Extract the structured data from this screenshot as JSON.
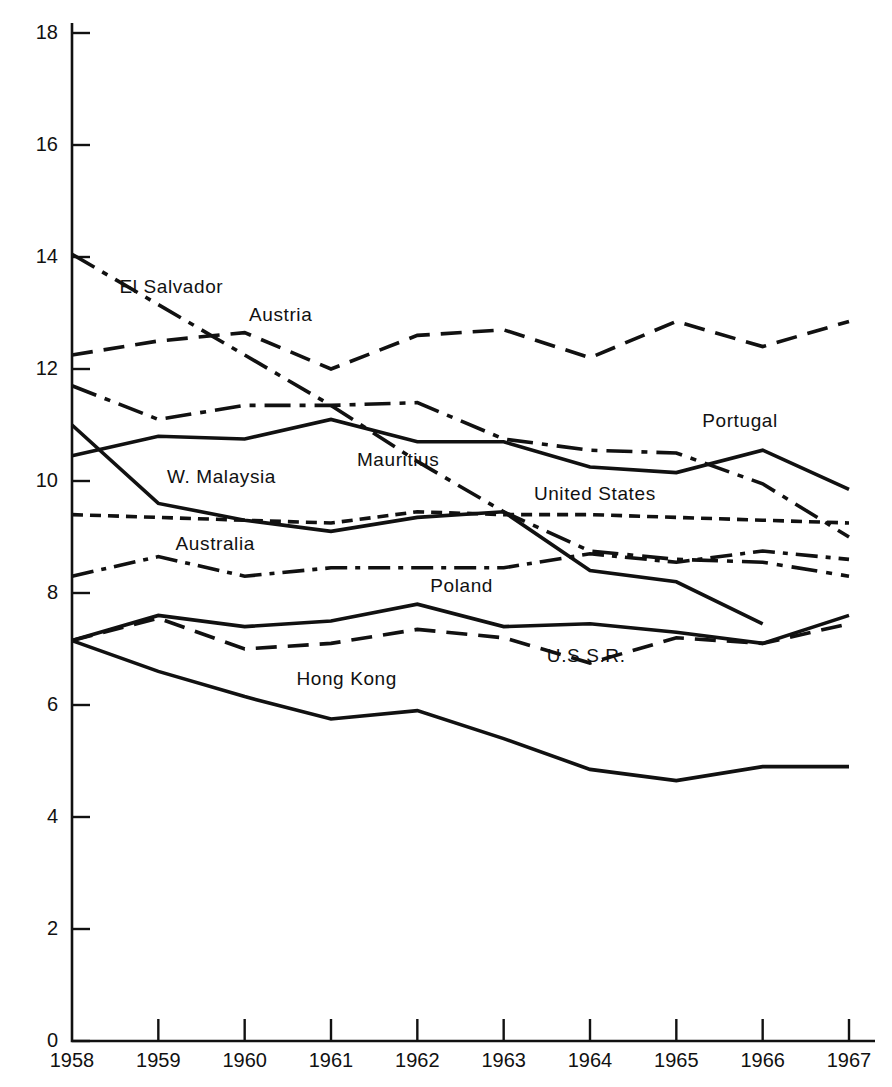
{
  "chart_data": {
    "type": "line",
    "title": "",
    "subtitle": "",
    "xlabel": "",
    "ylabel": "",
    "x": [
      1958,
      1959,
      1960,
      1961,
      1962,
      1963,
      1964,
      1965,
      1966,
      1967
    ],
    "categories": [
      "1958",
      "1959",
      "1960",
      "1961",
      "1962",
      "1963",
      "1964",
      "1965",
      "1966",
      "1967"
    ],
    "xlim": [
      1958,
      1967
    ],
    "ylim": [
      0,
      18
    ],
    "ytick_labels": [
      "0",
      "2",
      "4",
      "6",
      "8",
      "10",
      "12",
      "14",
      "16",
      "18"
    ],
    "ytick_values": [
      0,
      2,
      4,
      6,
      8,
      10,
      12,
      14,
      16,
      18
    ],
    "grid": false,
    "legend_position": "inline-labels",
    "series": [
      {
        "name": "El Salvador",
        "style": "dash-dot",
        "label": "El Salvador",
        "label_x": 1958.55,
        "label_y": 13.45,
        "values": [
          14.05,
          13.15,
          12.25,
          11.35,
          10.35,
          9.45,
          8.75,
          8.6,
          8.55,
          8.3
        ]
      },
      {
        "name": "Austria",
        "style": "long-dash",
        "label": "Austria",
        "label_x": 1960.05,
        "label_y": 12.95,
        "values": [
          12.25,
          12.5,
          12.65,
          12.0,
          12.6,
          12.7,
          12.2,
          12.85,
          12.4,
          12.85
        ]
      },
      {
        "name": "Mauritius",
        "style": "dash-dot",
        "label": "Mauritius",
        "label_x": 1961.3,
        "label_y": 10.35,
        "values": [
          11.7,
          11.1,
          11.35,
          11.35,
          11.4,
          10.75,
          10.55,
          10.5,
          9.95,
          9.0
        ]
      },
      {
        "name": "W. Malaysia",
        "style": "solid",
        "label": "W. Malaysia",
        "label_x": 1959.1,
        "label_y": 10.05,
        "values": [
          11.0,
          9.6,
          9.3,
          9.1,
          9.35,
          9.45,
          8.4,
          8.2,
          7.45,
          null
        ]
      },
      {
        "name": "Portugal",
        "style": "solid",
        "label": "Portugal",
        "label_x": 1965.3,
        "label_y": 11.05,
        "values": [
          10.45,
          10.8,
          10.75,
          11.1,
          10.7,
          10.7,
          10.25,
          10.15,
          10.55,
          9.85
        ]
      },
      {
        "name": "United States",
        "style": "short-dash",
        "label": "United States",
        "label_x": 1963.35,
        "label_y": 9.75,
        "values": [
          9.4,
          9.35,
          9.3,
          9.25,
          9.45,
          9.4,
          9.4,
          9.35,
          9.3,
          9.25
        ]
      },
      {
        "name": "Australia",
        "style": "long-dash-dot",
        "label": "Australia",
        "label_x": 1959.2,
        "label_y": 8.85,
        "values": [
          8.3,
          8.65,
          8.3,
          8.45,
          8.45,
          8.45,
          8.7,
          8.55,
          8.75,
          8.6
        ]
      },
      {
        "name": "Poland",
        "style": "solid",
        "label": "Poland",
        "label_x": 1962.15,
        "label_y": 8.1,
        "values": [
          7.15,
          7.6,
          7.4,
          7.5,
          7.8,
          7.4,
          7.45,
          7.3,
          7.1,
          7.6
        ]
      },
      {
        "name": "U.S.S.R.",
        "style": "long-dash",
        "label": "U.S.S.R.",
        "label_x": 1963.5,
        "label_y": 6.85,
        "values": [
          7.15,
          7.55,
          7.0,
          7.1,
          7.35,
          7.2,
          6.75,
          7.2,
          7.1,
          7.45
        ]
      },
      {
        "name": "Hong Kong",
        "style": "solid",
        "label": "Hong Kong",
        "label_x": 1960.6,
        "label_y": 6.45,
        "values": [
          7.15,
          6.6,
          6.15,
          5.75,
          5.9,
          5.4,
          4.85,
          4.65,
          4.9,
          4.9
        ]
      }
    ]
  },
  "axes": {
    "y_tick_labels": [
      "18",
      "16",
      "14",
      "12",
      "10",
      "8",
      "6",
      "4",
      "2",
      "0"
    ],
    "x_tick_labels": [
      "1958",
      "1959",
      "1960",
      "1961",
      "1962",
      "1963",
      "1964",
      "1965",
      "1966",
      "1967"
    ]
  },
  "colors": {
    "ink": "#111111",
    "background": "#ffffff"
  }
}
